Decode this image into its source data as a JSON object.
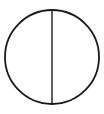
{
  "diagram": {
    "shape": "circle-with-vertical-diameter",
    "circle": {
      "cx": 52,
      "cy": 57,
      "r": 47,
      "stroke": "#1a1a1a",
      "stroke_width": 1.8,
      "fill": "#ffffff"
    },
    "diameter": {
      "x1": 52,
      "y1": 10,
      "x2": 52,
      "y2": 104,
      "stroke": "#1a1a1a",
      "stroke_width": 1.4
    }
  }
}
